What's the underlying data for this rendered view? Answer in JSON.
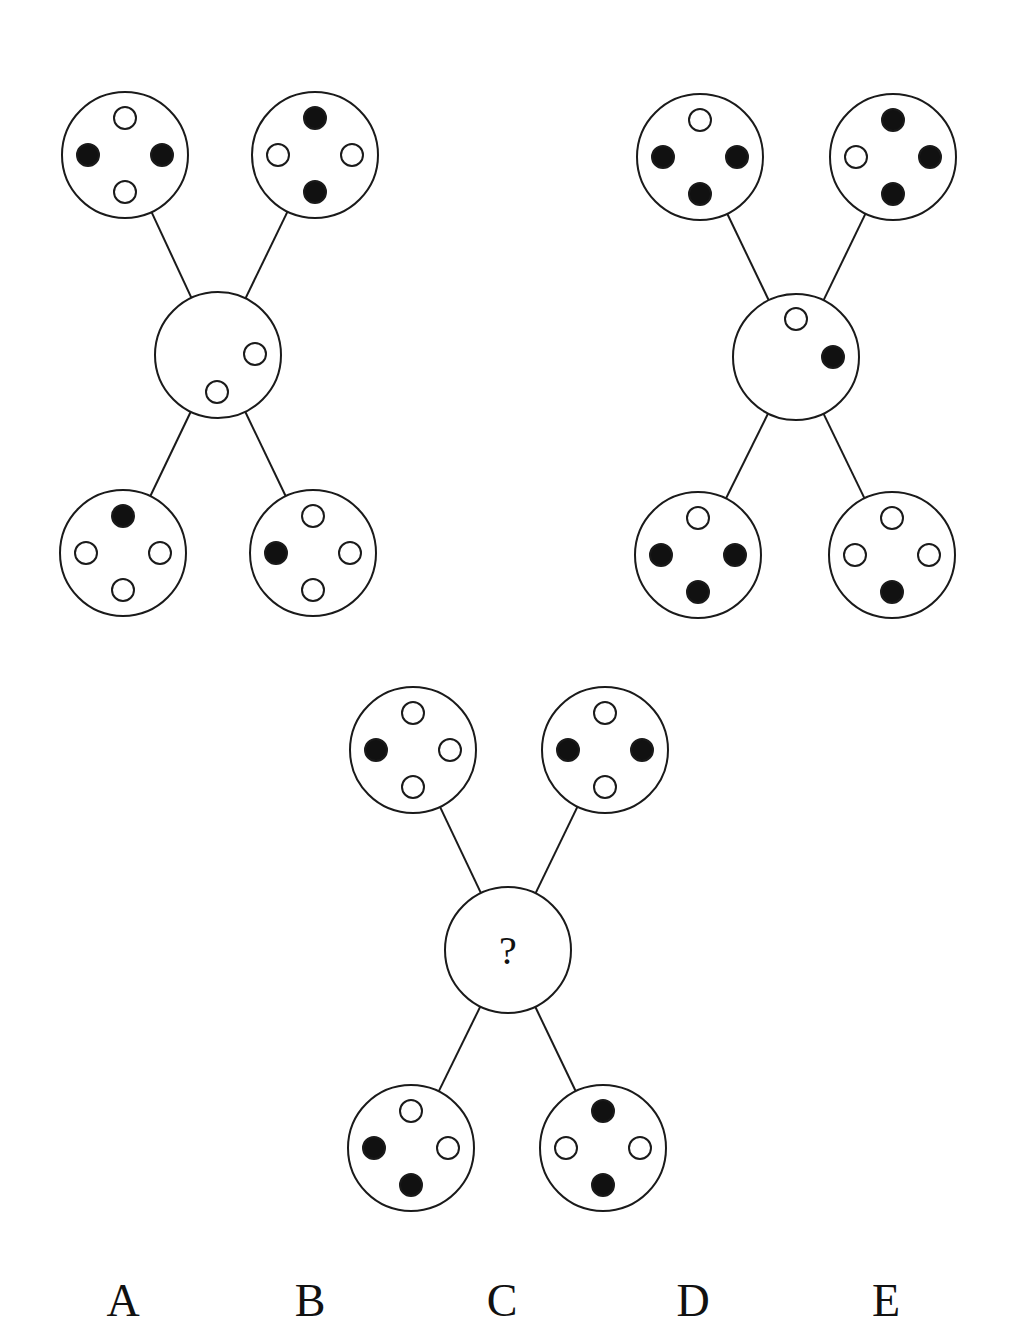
{
  "puzzle": {
    "description": "Pattern reasoning puzzle: three X-shaped diagrams, each with four outer circles connected to a central circle",
    "colors": {
      "stroke": "#1a1a1a",
      "filled_dot": "#111111",
      "empty_dot": "#ffffff",
      "background": "#ffffff"
    },
    "figures": [
      {
        "id": "figure-1",
        "center": {
          "x": 218,
          "y": 355,
          "r": 63,
          "label": "",
          "dots": [
            {
              "dx": 37,
              "dy": -1,
              "filled": false
            },
            {
              "dx": -1,
              "dy": 37,
              "filled": false
            }
          ]
        },
        "outer": [
          {
            "pos": "top-left",
            "x": 125,
            "y": 155,
            "dots": {
              "top": false,
              "left": true,
              "right": true,
              "bottom": false
            }
          },
          {
            "pos": "top-right",
            "x": 315,
            "y": 155,
            "dots": {
              "top": true,
              "left": false,
              "right": false,
              "bottom": true
            }
          },
          {
            "pos": "bottom-left",
            "x": 123,
            "y": 553,
            "dots": {
              "top": true,
              "left": false,
              "right": false,
              "bottom": false
            }
          },
          {
            "pos": "bottom-right",
            "x": 313,
            "y": 553,
            "dots": {
              "top": false,
              "left": true,
              "right": false,
              "bottom": false
            }
          }
        ]
      },
      {
        "id": "figure-2",
        "center": {
          "x": 796,
          "y": 357,
          "r": 63,
          "label": "",
          "dots": [
            {
              "dx": 0,
              "dy": -38,
              "filled": false
            },
            {
              "dx": 37,
              "dy": 0,
              "filled": true
            }
          ]
        },
        "outer": [
          {
            "pos": "top-left",
            "x": 700,
            "y": 157,
            "dots": {
              "top": false,
              "left": true,
              "right": true,
              "bottom": true
            }
          },
          {
            "pos": "top-right",
            "x": 893,
            "y": 157,
            "dots": {
              "top": true,
              "left": false,
              "right": true,
              "bottom": true
            }
          },
          {
            "pos": "bottom-left",
            "x": 698,
            "y": 555,
            "dots": {
              "top": false,
              "left": true,
              "right": true,
              "bottom": true
            }
          },
          {
            "pos": "bottom-right",
            "x": 892,
            "y": 555,
            "dots": {
              "top": false,
              "left": false,
              "right": false,
              "bottom": true
            }
          }
        ]
      },
      {
        "id": "figure-3",
        "center": {
          "x": 508,
          "y": 950,
          "r": 63,
          "label": "?",
          "dots": []
        },
        "outer": [
          {
            "pos": "top-left",
            "x": 413,
            "y": 750,
            "dots": {
              "top": false,
              "left": true,
              "right": false,
              "bottom": false
            }
          },
          {
            "pos": "top-right",
            "x": 605,
            "y": 750,
            "dots": {
              "top": false,
              "left": true,
              "right": true,
              "bottom": false
            }
          },
          {
            "pos": "bottom-left",
            "x": 411,
            "y": 1148,
            "dots": {
              "top": false,
              "left": true,
              "right": false,
              "bottom": true
            }
          },
          {
            "pos": "bottom-right",
            "x": 603,
            "y": 1148,
            "dots": {
              "top": true,
              "left": false,
              "right": false,
              "bottom": true
            }
          }
        ]
      }
    ],
    "options": [
      {
        "label": "A",
        "x": 123
      },
      {
        "label": "B",
        "x": 310
      },
      {
        "label": "C",
        "x": 502
      },
      {
        "label": "D",
        "x": 693
      },
      {
        "label": "E",
        "x": 886
      }
    ]
  }
}
